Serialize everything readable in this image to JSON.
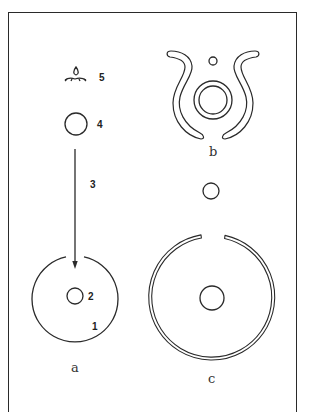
{
  "figure": {
    "panels": [
      {
        "id": "a",
        "label": "a",
        "numbered_parts": [
          {
            "number": "1",
            "description": "outer enclosure ring with opening at top"
          },
          {
            "number": "2",
            "description": "small central circle"
          },
          {
            "number": "3",
            "description": "arrow pointing down into enclosure"
          },
          {
            "number": "4",
            "description": "circle above arrow"
          },
          {
            "number": "5",
            "description": "fire / flame symbol"
          }
        ]
      },
      {
        "id": "b",
        "label": "b",
        "description": "two curved horn-like bands flanking concentric circles with a small circle above"
      },
      {
        "id": "c",
        "label": "c",
        "description": "large double-lined ring open at top with central circle and small circle above the opening"
      }
    ],
    "labels": {
      "n1": "1",
      "n2": "2",
      "n3": "3",
      "n4": "4",
      "n5": "5",
      "a": "a",
      "b": "b",
      "c": "c"
    },
    "colors": {
      "line": "#2a2a2a",
      "background": "#ffffff"
    }
  }
}
